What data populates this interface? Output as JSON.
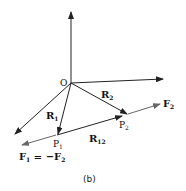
{
  "figure": {
    "caption": "(b)",
    "origin_label": "O",
    "points": {
      "p1": {
        "label": "P",
        "sub": "1"
      },
      "p2": {
        "label": "P",
        "sub": "2"
      }
    },
    "vectors": {
      "r1": {
        "label": "R",
        "sub": "1"
      },
      "r2": {
        "label": "R",
        "sub": "2"
      },
      "r12": {
        "label": "R",
        "sub": "12"
      },
      "f2": {
        "label": "F",
        "sub": "2"
      },
      "f1": {
        "label": "F",
        "sub": "1",
        "eq": " = −F",
        "eq_sub": "2"
      }
    },
    "colors": {
      "line": "#222222",
      "force": "#666666"
    }
  }
}
